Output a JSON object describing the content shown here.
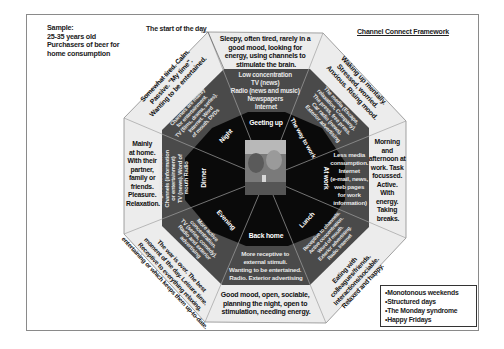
{
  "sample": {
    "lines": [
      "Sample:",
      "25-35 years old",
      "Purchasers of beer for",
      "home consumption"
    ]
  },
  "start_label": "The start of the day",
  "framework_title": "Channel Connect Framework",
  "legend": {
    "items": [
      "Monotonous weekends",
      "Structured days",
      "The Monday syndrome",
      "Happy Fridays"
    ]
  },
  "colors": {
    "outer_ring": "#ebebeb",
    "middle_ring": "#4a4a4a",
    "inner_ring": "#0a0a0a",
    "lines": "#9a9a9a"
  },
  "moments": [
    {
      "name": "Geeting up",
      "mood": [
        "Sleepy, often tired, rarely in a",
        "good mood, looking for",
        "energy, using channels to",
        "stimulate the brain."
      ],
      "channels": [
        "Low concentration",
        "TV (news)",
        "Radio (news and music)",
        "Newspapers",
        "Internet"
      ]
    },
    {
      "name": "The way to work",
      "mood": [
        "Waking up mentally.",
        "Stressed, worried.",
        "Anxious. Rising mood."
      ],
      "channels": [
        "The media (Escape,",
        "relaxation, Company).",
        "The press, free press.",
        "Car radio (news).",
        "Exterior advertising"
      ]
    },
    {
      "name": "At work",
      "mood": [
        "Morning",
        "and",
        "afternoon at",
        "work. Task",
        "focussed.",
        "Active.",
        "With",
        "energy.",
        "Taking",
        "breaks."
      ],
      "channels": [
        "Less media",
        "consumption.",
        "Internet",
        "(e-mail, news,",
        "web pages",
        "for work",
        "information)"
      ]
    },
    {
      "name": "Lunch",
      "mood": [
        "Eating with",
        "colleagues/friends.",
        "Interactions/sociable.",
        "Relaxed and happy."
      ],
      "channels": [
        "Receptive to channels.",
        "Active concentration.",
        "Word of mouth.",
        "Exterior advertising.",
        "Radio. Internet"
      ]
    },
    {
      "name": "Back home",
      "mood": [
        "Good mood, open, sociable,",
        "planning the night, open to",
        "stimulation, needing energy."
      ],
      "channels": [
        "More receptive to",
        "external stimuli.",
        "Wanting to be entertained.",
        "Radio. Exterior advertising"
      ]
    },
    {
      "name": "Evening",
      "mood": [
        "The war is over. The best",
        "moment of the day. Leisure time.",
        "Receptive to everything relaxing,",
        "entertaining or which keeps them up-to-date."
      ],
      "channels": [
        "More active",
        "concentration.",
        "TV (series, comedy).",
        "Radio and exterior",
        "advertising"
      ]
    },
    {
      "name": "Dinner",
      "mood": [
        "Mainly",
        "at home.",
        "With their",
        "partner,",
        "family or",
        "friends.",
        "Pleasure.",
        "Relaxation."
      ],
      "channels": [
        "High concentration.",
        "Channels (information",
        "or entertainment)",
        "TV (news). Word of",
        "mouth Radio"
      ]
    },
    {
      "name": "Night",
      "mood": [
        "Somewhat tired. Calm.",
        "Passive. \"My time\".",
        "Wanting to be entertained."
      ],
      "channels": [
        "Channels are mainly",
        "for entertainment.",
        "TV (films, drama, series).",
        "Internet. Word",
        "of mouth. DVDs"
      ]
    }
  ]
}
